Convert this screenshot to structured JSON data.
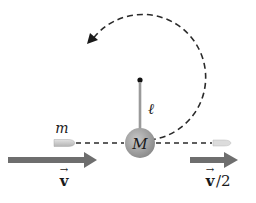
{
  "diagram": {
    "type": "physics-ballistic-pendulum",
    "labels": {
      "bullet_mass": "m",
      "block_mass": "M",
      "rod_length": "ℓ",
      "initial_velocity": "v",
      "final_velocity": "v",
      "final_velocity_suffix": "/2",
      "vector_arrow": "→"
    },
    "colors": {
      "background": "#ffffff",
      "ink": "#1a1a1a",
      "dash": "#2a2a2a",
      "rod": "#9a9a9a",
      "ball": "#8c8c8c",
      "ball_highlight": "#c8c8c8",
      "arrow": "#6e6e6e",
      "bullet": "#c9c9c9"
    }
  }
}
